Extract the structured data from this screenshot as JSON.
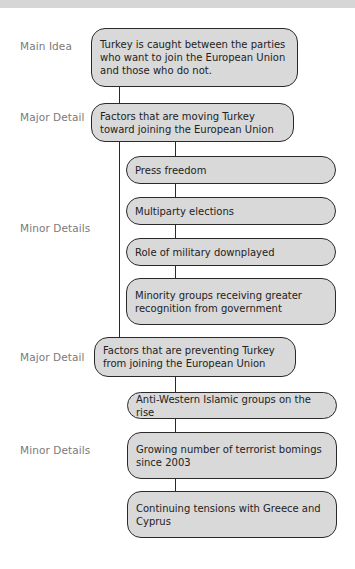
{
  "diagram": {
    "type": "main-idea-and-details-organizer",
    "labels": {
      "main_idea": "Main Idea",
      "major_detail_1": "Major Detail",
      "minor_details_1": "Minor Details",
      "major_detail_2": "Major Detail",
      "minor_details_2": "Minor Details"
    },
    "main_idea": "Turkey is caught between the parties who want to join the European Union and those who do not.",
    "major_details": [
      {
        "text": "Factors that are moving Turkey toward joining the European Union",
        "minor_details": [
          "Press freedom",
          "Multiparty elections",
          "Role of military downplayed",
          "Minority groups receiving greater recognition from government"
        ]
      },
      {
        "text": "Factors that are preventing Turkey from joining the European Union",
        "minor_details": [
          "Anti-Western Islamic groups on the rise",
          "Growing number of terrorist bomings since 2003",
          "Continuing tensions with Greece and Cyprus"
        ]
      }
    ],
    "colors": {
      "box_fill": "#d9d9d9",
      "box_border": "#2a2a2a",
      "label_text": "#7a7a7a",
      "top_band": "#d6d6d6"
    }
  }
}
